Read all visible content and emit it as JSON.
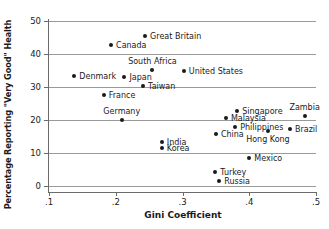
{
  "chart_data": {
    "type": "scatter",
    "title": "",
    "xlabel": "Gini Coefficient",
    "ylabel": "Percentage Reporting \"Very Good\" Health",
    "xlim": [
      0.1,
      0.5
    ],
    "ylim": [
      0,
      50
    ],
    "xticks": [
      ".1",
      ".2",
      ".3",
      ".4",
      ".5"
    ],
    "xtick_values": [
      0.1,
      0.2,
      0.3,
      0.4,
      0.5
    ],
    "yticks": [
      "0",
      "10",
      "20",
      "30",
      "40",
      "50"
    ],
    "ytick_values": [
      0,
      10,
      20,
      30,
      40,
      50
    ],
    "grid": "horizontal",
    "legend": "none",
    "marker": "filled-circle",
    "marker_color": "#1a1a1a",
    "points": [
      {
        "label": "Great Britain",
        "x": 0.244,
        "y": 45.5,
        "pos": "right"
      },
      {
        "label": "Canada",
        "x": 0.193,
        "y": 42.7,
        "pos": "right"
      },
      {
        "label": "South Africa",
        "x": 0.255,
        "y": 35.2,
        "pos": "above"
      },
      {
        "label": "United States",
        "x": 0.302,
        "y": 34.9,
        "pos": "right"
      },
      {
        "label": "Denmark",
        "x": 0.138,
        "y": 33.3,
        "pos": "right"
      },
      {
        "label": "Japan",
        "x": 0.213,
        "y": 33.1,
        "pos": "right"
      },
      {
        "label": "Taiwan",
        "x": 0.241,
        "y": 30.2,
        "pos": "right"
      },
      {
        "label": "France",
        "x": 0.182,
        "y": 27.5,
        "pos": "right"
      },
      {
        "label": "Singapore",
        "x": 0.382,
        "y": 22.8,
        "pos": "right"
      },
      {
        "label": "Zambia",
        "x": 0.483,
        "y": 21.3,
        "pos": "above"
      },
      {
        "label": "Malaysia",
        "x": 0.365,
        "y": 20.6,
        "pos": "right"
      },
      {
        "label": "Germany",
        "x": 0.209,
        "y": 20.1,
        "pos": "above"
      },
      {
        "label": "Philippines",
        "x": 0.379,
        "y": 18.0,
        "pos": "right"
      },
      {
        "label": "Brazil",
        "x": 0.461,
        "y": 17.3,
        "pos": "right"
      },
      {
        "label": "Hong Kong",
        "x": 0.428,
        "y": 16.6,
        "pos": "below"
      },
      {
        "label": "China",
        "x": 0.35,
        "y": 15.8,
        "pos": "right"
      },
      {
        "label": "India",
        "x": 0.269,
        "y": 13.2,
        "pos": "right"
      },
      {
        "label": "Korea",
        "x": 0.269,
        "y": 11.4,
        "pos": "right"
      },
      {
        "label": "Mexico",
        "x": 0.4,
        "y": 8.5,
        "pos": "right"
      },
      {
        "label": "Turkey",
        "x": 0.349,
        "y": 4.2,
        "pos": "right"
      },
      {
        "label": "Russia",
        "x": 0.355,
        "y": 1.6,
        "pos": "right"
      }
    ]
  }
}
